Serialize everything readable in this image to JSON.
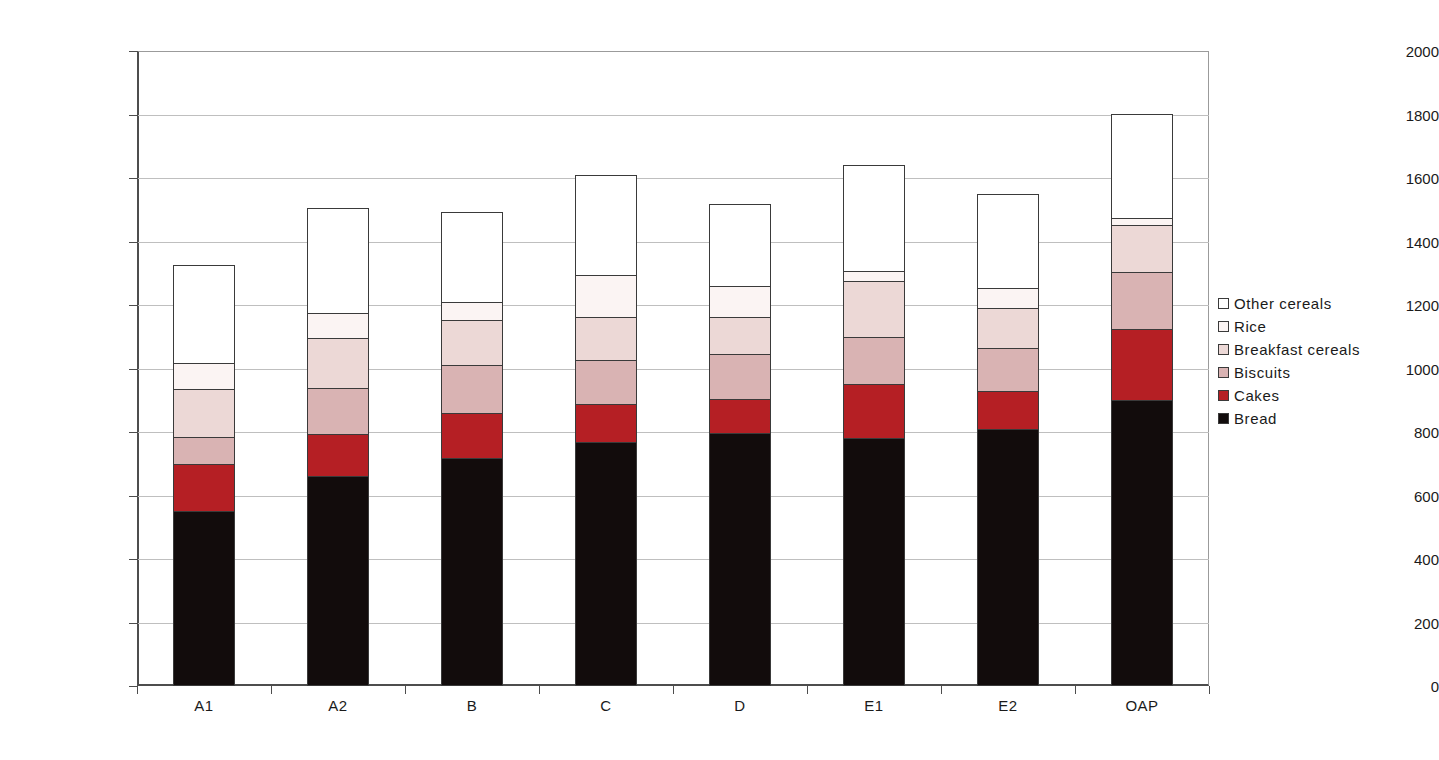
{
  "chart_data": {
    "type": "bar",
    "subtype": "stacked-bar",
    "title": "",
    "xlabel": "",
    "ylabel": "",
    "ylim": [
      0,
      2000
    ],
    "ytick_step": 200,
    "yticks": [
      0,
      200,
      400,
      600,
      800,
      1000,
      1200,
      1400,
      1600,
      1800,
      2000
    ],
    "ytick_labels": [
      "0",
      "200",
      "400",
      "600",
      "800",
      "1000",
      "1200",
      "1400",
      "1600",
      "1800",
      "2000"
    ],
    "grid": true,
    "grid_axis": "y",
    "legend_position": "right",
    "categories": [
      "A1",
      "A2",
      "B",
      "C",
      "D",
      "E1",
      "E2",
      "OAP"
    ],
    "series": [
      {
        "name": "Bread",
        "color": "#120c0c",
        "values": [
          548,
          658,
          715,
          764,
          793,
          777,
          806,
          898
        ]
      },
      {
        "name": "Cakes",
        "color": "#b51f24",
        "values": [
          148,
          132,
          142,
          122,
          107,
          172,
          121,
          223
        ]
      },
      {
        "name": "Biscuits",
        "color": "#d9b3b3",
        "values": [
          85,
          145,
          151,
          139,
          142,
          148,
          136,
          180
        ]
      },
      {
        "name": "Breakfast cereals",
        "color": "#ecd8d6",
        "values": [
          151,
          157,
          142,
          135,
          116,
          176,
          126,
          148
        ]
      },
      {
        "name": "Rice",
        "color": "#fbf4f3",
        "values": [
          82,
          79,
          57,
          132,
          98,
          32,
          63,
          23
        ]
      },
      {
        "name": "Other cereals",
        "color": "#ffffff",
        "values": [
          309,
          331,
          282,
          313,
          259,
          334,
          296,
          326
        ]
      }
    ],
    "totals": [
      1323,
      1502,
      1489,
      1605,
      1515,
      1639,
      1548,
      1798
    ],
    "legend_entries": [
      {
        "label": "Other cereals",
        "color": "#ffffff"
      },
      {
        "label": "Rice",
        "color": "#fbf4f3"
      },
      {
        "label": "Breakfast cereals",
        "color": "#ecd8d6"
      },
      {
        "label": "Biscuits",
        "color": "#d9b3b3"
      },
      {
        "label": "Cakes",
        "color": "#b51f24"
      },
      {
        "label": "Bread",
        "color": "#120c0c"
      }
    ]
  }
}
